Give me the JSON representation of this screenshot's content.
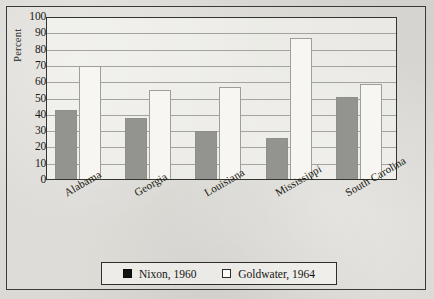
{
  "chart_data": {
    "type": "bar",
    "title": "",
    "xlabel": "",
    "ylabel": "Percent",
    "ylim": [
      0,
      100
    ],
    "yticks": [
      100,
      90,
      80,
      70,
      60,
      50,
      40,
      30,
      20,
      10,
      0
    ],
    "grid": true,
    "legend_position": "bottom",
    "categories": [
      "Alabama",
      "Georgia",
      "Louisiana",
      "Mississippi",
      "South Carolina"
    ],
    "series": [
      {
        "name": "Nixon, 1960",
        "swatch": "filled",
        "color": "#131310",
        "values": [
          43,
          38,
          30,
          26,
          51
        ]
      },
      {
        "name": "Goldwater, 1964",
        "swatch": "hollow",
        "color": "#fbfaf7",
        "values": [
          70,
          55,
          57,
          87,
          59
        ]
      }
    ]
  },
  "legend": {
    "items": [
      {
        "label": "Nixon, 1960",
        "swatch": "filled"
      },
      {
        "label": "Goldwater, 1964",
        "swatch": "hollow"
      }
    ]
  }
}
